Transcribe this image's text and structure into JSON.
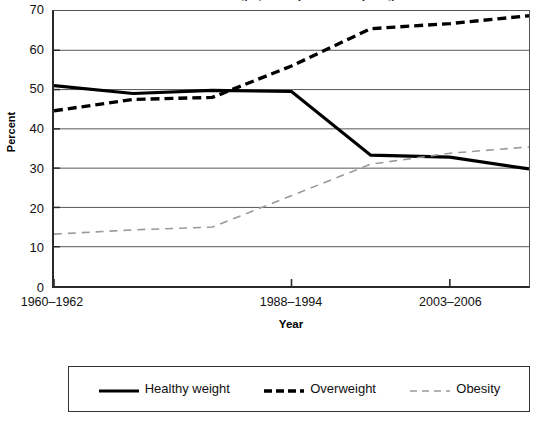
{
  "chart_data": {
    "type": "line",
    "title": "Trends in overweight, obesity and healthy weight",
    "xlabel": "Year",
    "ylabel": "Percent",
    "ylim": [
      0,
      70
    ],
    "ytick_values": [
      70,
      60,
      50,
      40,
      30,
      20,
      10,
      0
    ],
    "ytick_labels": [
      "70",
      "60",
      "50",
      "40",
      "30",
      "20",
      "10",
      "0"
    ],
    "grid": true,
    "grid_axis": "y",
    "legend_position": "bottom",
    "x": [
      "1960-1962",
      "1971-1974",
      "1976-1980",
      "1988-1994",
      "1999-2002",
      "2003-2006",
      "2007-2008"
    ],
    "xtick_labels": [
      "1960–1962",
      "1988–1994",
      "2003–2006"
    ],
    "xtick_label_indices": [
      0,
      3,
      5
    ],
    "series": [
      {
        "name": "Healthy weight",
        "values": [
          51.0,
          49.0,
          49.8,
          49.5,
          33.3,
          32.8,
          29.8
        ],
        "color": "#000000",
        "style": "solid",
        "width": 3.2
      },
      {
        "name": "Overweight",
        "values": [
          44.6,
          47.5,
          48.0,
          56.0,
          65.5,
          66.8,
          68.8
        ],
        "color": "#000000",
        "style": "dashed",
        "width": 3.4
      },
      {
        "name": "Obesity",
        "values": [
          13.2,
          14.3,
          15.0,
          23.0,
          31.0,
          33.8,
          35.4
        ],
        "color": "#9a9a9a",
        "style": "dashed",
        "width": 1.6
      }
    ]
  },
  "axis": {
    "y_title": "Percent",
    "x_title": "Year"
  },
  "legend": {
    "items": [
      {
        "label": "Healthy weight",
        "swatch": "solid-thick-black-line-icon"
      },
      {
        "label": "Overweight",
        "swatch": "dashed-thick-black-line-icon"
      },
      {
        "label": "Obesity",
        "swatch": "dashed-thin-gray-line-icon"
      }
    ]
  }
}
